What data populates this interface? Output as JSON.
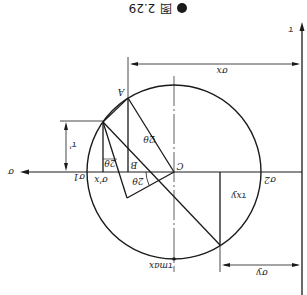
{
  "figure": {
    "caption_bullet": "●",
    "caption_icon": "图",
    "caption_number": "2.29",
    "orientation": "rotated 180°"
  },
  "axes": {
    "sigma_label": "σ",
    "tau_label": "τ"
  },
  "points": {
    "center": "C",
    "A": "A",
    "B": "B"
  },
  "labels": {
    "sigma_x": "σx",
    "sigma_y": "σy",
    "tau_xy": "τxy",
    "sigma_1": "σ1",
    "sigma_2": "σ2",
    "sigma_x_prime": "σ'x",
    "tau_prime": "τ'",
    "tau_max": "τmax",
    "angle_2theta": "2θ"
  }
}
